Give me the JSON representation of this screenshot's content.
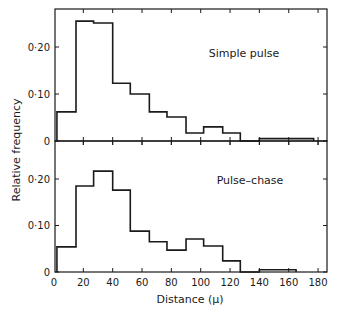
{
  "chart_data": {
    "type": "bar",
    "subtype": "step-histogram",
    "layout": "two stacked panels sharing x-axis",
    "xlabel": "Distance (μ)",
    "ylabel": "Relative frequency",
    "xlim": [
      0,
      186
    ],
    "x_ticks": [
      0,
      20,
      40,
      60,
      80,
      100,
      120,
      140,
      160,
      180
    ],
    "x_tick_labels": [
      "0",
      "20",
      "40",
      "60",
      "80",
      "100",
      "120",
      "140",
      "160",
      "180"
    ],
    "grid": false,
    "legend": null,
    "panels": [
      {
        "label": "Simple pulse",
        "ylim": [
          0,
          0.28
        ],
        "y_ticks": [
          0,
          0.1,
          0.2
        ],
        "y_tick_labels": [
          "0",
          "0·10",
          "0·20"
        ],
        "bin_edges": [
          2,
          15,
          27,
          40,
          52,
          65,
          77,
          90,
          102,
          115,
          127,
          140,
          153,
          165,
          177
        ],
        "values": [
          0.062,
          0.255,
          0.251,
          0.123,
          0.1,
          0.062,
          0.051,
          0.017,
          0.03,
          0.017,
          0.0,
          0.005,
          0.005,
          0.005
        ]
      },
      {
        "label": "Pulse–chase",
        "ylim": [
          0,
          0.28
        ],
        "y_ticks": [
          0,
          0.1,
          0.2
        ],
        "y_tick_labels": [
          "0",
          "0·10",
          "0·20"
        ],
        "bin_edges": [
          2,
          15,
          27,
          40,
          52,
          65,
          77,
          90,
          102,
          115,
          127,
          140,
          153,
          165
        ],
        "values": [
          0.054,
          0.185,
          0.217,
          0.176,
          0.088,
          0.065,
          0.047,
          0.071,
          0.056,
          0.024,
          0.0,
          0.005,
          0.005
        ]
      }
    ]
  }
}
